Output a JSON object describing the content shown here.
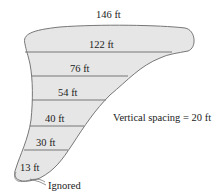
{
  "diagram": {
    "type": "cross-section widths of a pond/region",
    "top_width_label": "146 ft",
    "width_labels": [
      "122 ft",
      "76 ft",
      "54 ft",
      "40 ft",
      "30 ft",
      "13 ft"
    ],
    "spacing_note": "Vertical spacing = 20 ft",
    "ignored_label": "Ignored",
    "colors": {
      "fill": "#e6e6e6",
      "stroke": "#777777",
      "text": "#222222"
    }
  }
}
